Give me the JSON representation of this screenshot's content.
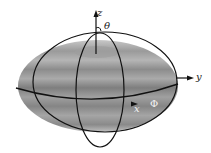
{
  "figure": {
    "labels": {
      "z_axis": "z",
      "y_axis": "y",
      "x_axis": "x",
      "theta": "θ",
      "phi": "Φ"
    },
    "colors": {
      "shape_light": "#b8b8b8",
      "shape_mid": "#8f8f8f",
      "shape_dark": "#6a6a6a",
      "lines": "#111111"
    }
  }
}
